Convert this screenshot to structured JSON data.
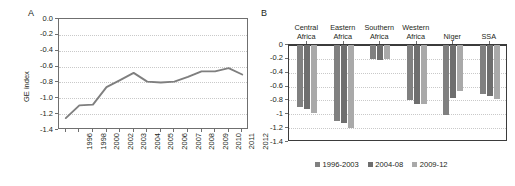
{
  "figure": {
    "panel_a_letter": "A",
    "panel_b_letter": "B"
  },
  "chart_data": [
    {
      "type": "line",
      "panel": "A",
      "title": "",
      "xlabel": "",
      "ylabel": "GE index",
      "ylim": [
        -1.4,
        0.0
      ],
      "yticks": [
        "0.0",
        "-0.2",
        "-0.4",
        "-0.6",
        "-0.8",
        "-1.0",
        "-1.2",
        "-1.4"
      ],
      "ytick_values": [
        0.0,
        -0.2,
        -0.4,
        -0.6,
        -0.8,
        -1.0,
        -1.2,
        -1.4
      ],
      "grid": true,
      "legend": "none",
      "x": [
        "1996",
        "1998",
        "2000",
        "2002",
        "2003",
        "2004",
        "2005",
        "2006",
        "2007",
        "2008",
        "2009",
        "2010",
        "2011",
        "2012"
      ],
      "values": [
        -1.25,
        -1.09,
        -1.08,
        -0.86,
        -0.77,
        -0.68,
        -0.79,
        -0.8,
        -0.79,
        -0.73,
        -0.66,
        -0.66,
        -0.62,
        -0.7
      ],
      "series_color": "#7f7f7f"
    },
    {
      "type": "bar",
      "panel": "B",
      "title": "",
      "xlabel": "",
      "ylabel": "",
      "ylim": [
        -1.4,
        0.0
      ],
      "yticks": [
        "0",
        "-0.2",
        "-0.4",
        "-0.6",
        "-0.8",
        "-1",
        "-1.2",
        "-1.4"
      ],
      "ytick_values": [
        0.0,
        -0.2,
        -0.4,
        -0.6,
        -0.8,
        -1.0,
        -1.2,
        -1.4
      ],
      "grid": true,
      "legend_position": "bottom",
      "categories": [
        "Central Africa",
        "Eastern Africa",
        "Southern Africa",
        "Western Africa",
        "Niger",
        "SSA"
      ],
      "category_lines": [
        [
          "Central",
          "Africa"
        ],
        [
          "Eastern",
          "Africa"
        ],
        [
          "Southern",
          "Africa"
        ],
        [
          "Western",
          "Africa"
        ],
        [
          "Niger",
          ""
        ],
        [
          "SSA",
          ""
        ]
      ],
      "series": [
        {
          "name": "1996-2003",
          "color": "#808080",
          "values": [
            -0.9,
            -1.1,
            -0.2,
            -0.79,
            -1.01,
            -0.71
          ]
        },
        {
          "name": "2004-08",
          "color": "#6e6e6e",
          "values": [
            -0.93,
            -1.13,
            -0.22,
            -0.85,
            -0.77,
            -0.74
          ]
        },
        {
          "name": "2009-12",
          "color": "#a9a9a9",
          "values": [
            -0.98,
            -1.2,
            -0.2,
            -0.85,
            -0.67,
            -0.78
          ]
        }
      ]
    }
  ]
}
